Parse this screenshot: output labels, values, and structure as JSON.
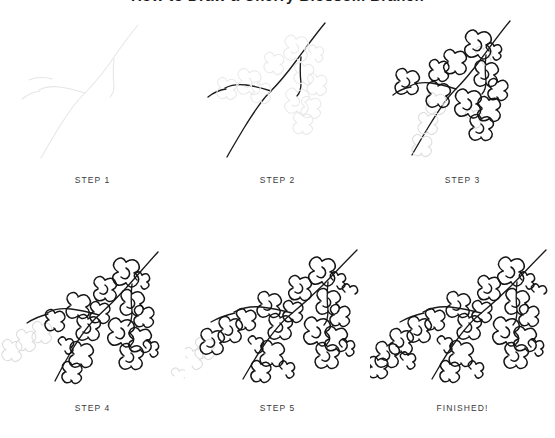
{
  "header": {
    "title": "How to Draw a Cherry Blossom Branch",
    "title_visible": "partially-cropped"
  },
  "tutorial": {
    "subject": "cherry-blossom-branch",
    "style": "line-art",
    "total_steps": 6,
    "ink_color": "#1a1a1a",
    "guide_color": "#e6e6e6",
    "caption_color": "#3a3a3a",
    "background_color": "#ffffff"
  },
  "steps": [
    {
      "id": "step-1",
      "label": "STEP 1",
      "row": 1,
      "column": 1,
      "description": "Light guideline sketch of the bare branch",
      "inked_branch": false,
      "inked_flowers": 0,
      "guide_flowers": 0
    },
    {
      "id": "step-2",
      "label": "STEP 2",
      "row": 1,
      "column": 2,
      "description": "Branch darkened, blossoms still light guidelines",
      "inked_branch": true,
      "inked_flowers": 0,
      "guide_flowers": 11
    },
    {
      "id": "step-3",
      "label": "STEP 3",
      "row": 1,
      "column": 3,
      "description": "Most blossoms inked, a few guides remain",
      "inked_branch": true,
      "inked_flowers": 11,
      "guide_flowers": 5
    },
    {
      "id": "step-4",
      "label": "STEP 4",
      "row": 2,
      "column": 1,
      "description": "More blossoms added along the lower branch",
      "inked_branch": true,
      "inked_flowers": 16,
      "guide_flowers": 4
    },
    {
      "id": "step-5",
      "label": "STEP 5",
      "row": 2,
      "column": 2,
      "description": "Branch tip filled with additional blossoms",
      "inked_branch": true,
      "inked_flowers": 20,
      "guide_flowers": 2
    },
    {
      "id": "step-6",
      "label": "FINISHED!",
      "row": 2,
      "column": 3,
      "description": "Completed cherry blossom branch drawing",
      "inked_branch": true,
      "inked_flowers": 23,
      "guide_flowers": 0
    }
  ]
}
